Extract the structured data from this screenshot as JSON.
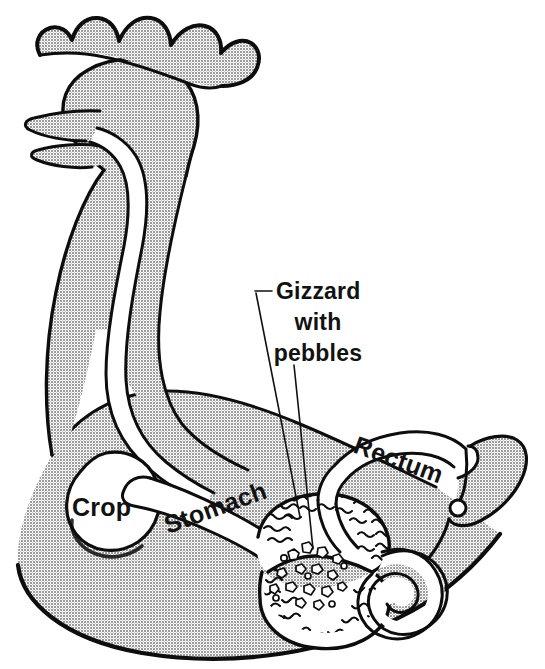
{
  "figure": {
    "view": "left lateral cutaway",
    "background_color": "#ffffff",
    "body_fill_color": "#a8a8a8",
    "organ_fill_color": "#ffffff",
    "outline_color": "#0d0d0d",
    "label_color": "#121212"
  },
  "callouts": [
    {
      "id": "gizzard",
      "lines": [
        "Gizzard",
        "with",
        "pebbles"
      ],
      "line1": "Gizzard",
      "line2": "with",
      "line3": "pebbles",
      "text_anchor_x": 318,
      "leader_count": 2,
      "points_to": [
        "gizzard-wall",
        "pebble-cavity"
      ]
    }
  ],
  "organ_labels": [
    {
      "id": "crop",
      "text": "Crop",
      "rotation_deg": 0,
      "x": 72,
      "y": 516
    },
    {
      "id": "stomach",
      "text": "Stomach",
      "rotation_deg": -20,
      "x": 168,
      "y": 534
    },
    {
      "id": "rectum",
      "text": "Rectum",
      "rotation_deg": 20,
      "x": 352,
      "y": 452
    }
  ],
  "organs": [
    {
      "id": "comb",
      "name": "comb",
      "fill": "#a8a8a8"
    },
    {
      "id": "beak",
      "name": "beak",
      "fill": "#a8a8a8"
    },
    {
      "id": "head",
      "name": "head",
      "fill": "#a8a8a8"
    },
    {
      "id": "esophagus",
      "name": "esophagus",
      "fill": "#ffffff"
    },
    {
      "id": "crop",
      "name": "crop",
      "fill": "#ffffff"
    },
    {
      "id": "stomach",
      "name": "stomach (proventriculus)",
      "fill": "#ffffff"
    },
    {
      "id": "gizzard",
      "name": "gizzard",
      "fill": "#ffffff"
    },
    {
      "id": "pebbles",
      "name": "pebbles",
      "fill": "#ffffff"
    },
    {
      "id": "intestine",
      "name": "intestine",
      "fill": "#ffffff"
    },
    {
      "id": "rectum",
      "name": "rectum",
      "fill": "#ffffff"
    },
    {
      "id": "vent",
      "name": "vent",
      "fill": "#ffffff"
    },
    {
      "id": "tail",
      "name": "tail",
      "fill": "#a8a8a8"
    },
    {
      "id": "body",
      "name": "body",
      "fill": "#a8a8a8"
    }
  ]
}
